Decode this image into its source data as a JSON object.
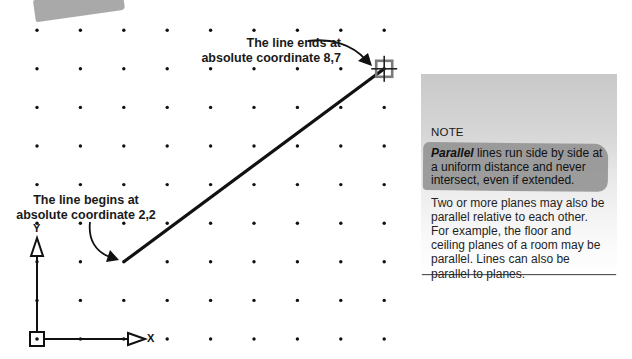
{
  "diagram": {
    "type": "absolute-coordinate-line",
    "grid": {
      "columns": 9,
      "rows": 9,
      "origin_px": [
        37,
        339
      ],
      "spacing_x_px": 43.4,
      "spacing_y_px": 38.6
    },
    "line": {
      "start": {
        "x": 2,
        "y": 2
      },
      "end": {
        "x": 8,
        "y": 7
      }
    },
    "axes": {
      "x_label": "X",
      "y_label": "Y"
    },
    "callouts": {
      "end": {
        "line1": "The line ends at",
        "line2": "absolute coordinate 8,7"
      },
      "start": {
        "line1": "The line begins at",
        "line2": "absolute coordinate 2,2"
      }
    },
    "icons": {
      "end_marker": "crosshair-square-icon",
      "origin_marker": "ucs-origin-square-icon",
      "axis_arrow": "hollow-triangle-arrow-icon"
    },
    "colors": {
      "line": "#111111",
      "dots": "#111111",
      "end_marker": "#7a7a7a",
      "note_top": "#c9c9c9",
      "note_bottom": "#ffffff",
      "highlight": "#8e8e8e"
    }
  },
  "note": {
    "title": "NOTE",
    "definition_term": "Parallel",
    "definition_rest": " lines run side by side at a uniform distance and never intersect, even if extended.",
    "body": "Two or more planes may also be parallel relative to each other. For example, the floor and ceiling planes of a room may be parallel. Lines can also be parallel to planes."
  }
}
